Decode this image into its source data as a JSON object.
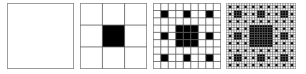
{
  "figure": {
    "line_color": "#555555",
    "fill_color": "#000000",
    "background": "#ffffff",
    "panels": [
      {
        "iteration": 0,
        "left": 7,
        "width": 67
      },
      {
        "iteration": 1,
        "left": 80,
        "width": 67
      },
      {
        "iteration": 2,
        "left": 153,
        "width": 68
      },
      {
        "iteration": 3,
        "left": 226,
        "width": 70
      }
    ]
  }
}
